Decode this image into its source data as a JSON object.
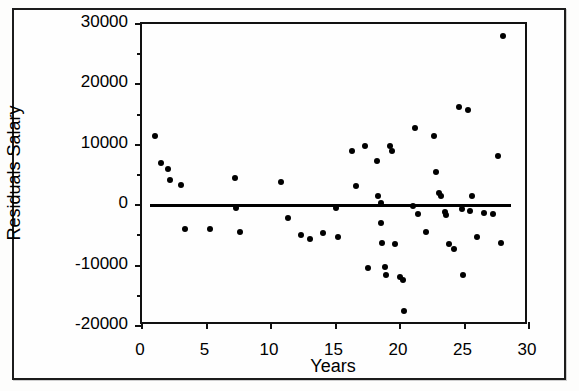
{
  "figure": {
    "background_color": "#ffffff",
    "ink_color": "#000000"
  },
  "chart_data": {
    "type": "scatter",
    "title": "",
    "xlabel": "Years",
    "ylabel": "Residuals Salary",
    "xlim": [
      0,
      30
    ],
    "ylim": [
      -20000,
      30000
    ],
    "xticks": [
      0,
      5,
      10,
      15,
      20,
      25,
      30
    ],
    "xtick_labels": [
      "0",
      "5",
      "10",
      "15",
      "20",
      "25",
      "30"
    ],
    "yticks": [
      -20000,
      -10000,
      0,
      10000,
      20000,
      30000
    ],
    "ytick_labels": [
      "-20000",
      "-10000",
      "0",
      "10000",
      "20000",
      "30000"
    ],
    "ytick_minor": [
      -15000,
      -5000,
      5000,
      15000,
      25000
    ],
    "grid": false,
    "legend": null,
    "reference_line": {
      "type": "horizontal",
      "y": 0,
      "x_start": 0.6,
      "x_end": 28.6,
      "color": "#000000",
      "width_px": 3
    },
    "marker": {
      "shape": "circle",
      "filled": true,
      "color": "#000000",
      "size_px": 6
    },
    "points": [
      {
        "x": 1.0,
        "y": 11500
      },
      {
        "x": 1.5,
        "y": 7000
      },
      {
        "x": 2.0,
        "y": 6000
      },
      {
        "x": 2.2,
        "y": 4200
      },
      {
        "x": 3.0,
        "y": 3300
      },
      {
        "x": 3.3,
        "y": -3900
      },
      {
        "x": 5.3,
        "y": -4000
      },
      {
        "x": 7.2,
        "y": 4500
      },
      {
        "x": 7.3,
        "y": -400
      },
      {
        "x": 7.6,
        "y": -4400
      },
      {
        "x": 10.8,
        "y": 3900
      },
      {
        "x": 11.3,
        "y": -2200
      },
      {
        "x": 12.3,
        "y": -4900
      },
      {
        "x": 13.0,
        "y": -5600
      },
      {
        "x": 14.0,
        "y": -4600
      },
      {
        "x": 15.0,
        "y": -400
      },
      {
        "x": 15.2,
        "y": -5300
      },
      {
        "x": 16.3,
        "y": 9000
      },
      {
        "x": 16.6,
        "y": 3100
      },
      {
        "x": 17.3,
        "y": 9800
      },
      {
        "x": 17.5,
        "y": -10400
      },
      {
        "x": 18.2,
        "y": 7400
      },
      {
        "x": 18.3,
        "y": 1500
      },
      {
        "x": 18.5,
        "y": 300
      },
      {
        "x": 18.5,
        "y": -3000
      },
      {
        "x": 18.6,
        "y": -6200
      },
      {
        "x": 18.8,
        "y": -10200
      },
      {
        "x": 18.9,
        "y": -11600
      },
      {
        "x": 19.2,
        "y": 9800
      },
      {
        "x": 19.4,
        "y": 9000
      },
      {
        "x": 19.6,
        "y": -6400
      },
      {
        "x": 20.0,
        "y": -11900
      },
      {
        "x": 20.2,
        "y": -12400
      },
      {
        "x": 20.3,
        "y": -17500
      },
      {
        "x": 21.0,
        "y": -200
      },
      {
        "x": 21.2,
        "y": 12800
      },
      {
        "x": 21.4,
        "y": -1400
      },
      {
        "x": 22.0,
        "y": -4500
      },
      {
        "x": 22.6,
        "y": 11400
      },
      {
        "x": 22.8,
        "y": 5500
      },
      {
        "x": 23.0,
        "y": 2000
      },
      {
        "x": 23.2,
        "y": 1600
      },
      {
        "x": 23.5,
        "y": -1100
      },
      {
        "x": 23.6,
        "y": -1700
      },
      {
        "x": 23.8,
        "y": -6400
      },
      {
        "x": 24.2,
        "y": -7300
      },
      {
        "x": 24.6,
        "y": 16200
      },
      {
        "x": 24.8,
        "y": -600
      },
      {
        "x": 24.9,
        "y": -11500
      },
      {
        "x": 25.3,
        "y": 15800
      },
      {
        "x": 25.4,
        "y": -900
      },
      {
        "x": 25.6,
        "y": 1600
      },
      {
        "x": 26.0,
        "y": -5300
      },
      {
        "x": 26.5,
        "y": -1300
      },
      {
        "x": 27.2,
        "y": -1500
      },
      {
        "x": 27.6,
        "y": 8200
      },
      {
        "x": 27.8,
        "y": -6200
      },
      {
        "x": 28.0,
        "y": 28000
      }
    ]
  }
}
